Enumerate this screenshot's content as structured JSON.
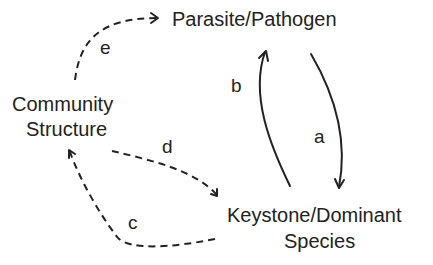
{
  "diagram": {
    "nodes": {
      "parasite": {
        "label": "Parasite/Pathogen"
      },
      "community": {
        "line1": "Community",
        "line2": "Structure"
      },
      "keystone": {
        "line1": "Keystone/Dominant",
        "line2": "Species"
      }
    },
    "edges": {
      "a": {
        "label": "a",
        "from": "Parasite/Pathogen",
        "to": "Keystone/Dominant Species",
        "style": "solid"
      },
      "b": {
        "label": "b",
        "from": "Keystone/Dominant Species",
        "to": "Parasite/Pathogen",
        "style": "solid"
      },
      "c": {
        "label": "c",
        "from": "Keystone/Dominant Species",
        "to": "Community Structure",
        "style": "dashed"
      },
      "d": {
        "label": "d",
        "from": "Community Structure",
        "to": "Keystone/Dominant Species",
        "style": "dashed"
      },
      "e": {
        "label": "e",
        "from": "Community Structure",
        "to": "Parasite/Pathogen",
        "style": "dashed"
      }
    },
    "colors": {
      "ink": "#222222",
      "background": "#ffffff"
    }
  }
}
